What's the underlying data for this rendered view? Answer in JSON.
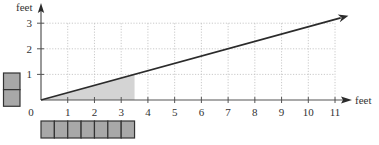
{
  "chart_data": {
    "type": "line",
    "title": "",
    "xlabel": "feet",
    "ylabel": "feet",
    "xlim": [
      0,
      11
    ],
    "ylim": [
      0,
      3
    ],
    "x_ticks": [
      0,
      1,
      2,
      3,
      4,
      5,
      6,
      7,
      8,
      9,
      10,
      11
    ],
    "y_ticks": [
      1,
      2,
      3
    ],
    "x_tick_labels": [
      "0",
      "1",
      "2",
      "3",
      "4",
      "5",
      "6",
      "7",
      "8",
      "9",
      "10",
      "11"
    ],
    "y_tick_labels": [
      "1",
      "2",
      "3"
    ],
    "grid": true,
    "series": [
      {
        "name": "ratio line",
        "slope": 0.2857,
        "points": [
          [
            0,
            0
          ],
          [
            3.5,
            1
          ],
          [
            7,
            2
          ],
          [
            11.5,
            3.29
          ]
        ],
        "arrow": true
      }
    ],
    "shaded_region": {
      "description": "area under line from x=0 to x=3.5",
      "x_range": [
        0,
        3.5
      ],
      "corner_point": [
        3.5,
        1
      ]
    },
    "unit_blocks": {
      "horizontal_count": 7,
      "horizontal_block_size_feet": 0.5,
      "vertical_count": 2,
      "vertical_block_size_feet": 0.5
    }
  },
  "colors": {
    "line": "#2b2b2b",
    "grid": "#bdbdbd",
    "axis": "#555555",
    "shade": "#d4d4d4",
    "block_fill": "#a8a8a8",
    "block_stroke": "#333333"
  }
}
